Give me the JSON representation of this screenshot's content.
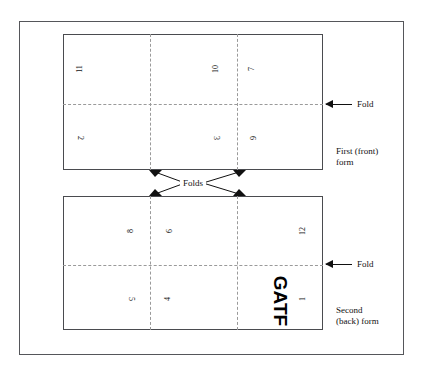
{
  "diagram": {
    "title_visible": false,
    "outer_frame": "figure-border",
    "forms": [
      {
        "id": "front",
        "label": "First (front)\nform",
        "page_numbers": [
          {
            "value": "11",
            "panel": "top-left",
            "rotation": "ccw"
          },
          {
            "value": "10",
            "panel": "top-center-right",
            "rotation": "ccw"
          },
          {
            "value": "7",
            "panel": "top-right",
            "rotation": "ccw"
          },
          {
            "value": "2",
            "panel": "bottom-left",
            "rotation": "cw"
          },
          {
            "value": "3",
            "panel": "bottom-center-right",
            "rotation": "cw"
          },
          {
            "value": "6",
            "panel": "bottom-right",
            "rotation": "cw"
          }
        ]
      },
      {
        "id": "back",
        "label": "Second\n(back) form",
        "page_numbers": [
          {
            "value": "8",
            "panel": "top-left-center",
            "rotation": "ccw"
          },
          {
            "value": "9",
            "panel": "top-center",
            "rotation": "cw"
          },
          {
            "value": "12",
            "panel": "top-right",
            "rotation": "ccw"
          },
          {
            "value": "5",
            "panel": "bottom-left-center",
            "rotation": "cw"
          },
          {
            "value": "4",
            "panel": "bottom-center",
            "rotation": "ccw"
          },
          {
            "value": "1",
            "panel": "bottom-right",
            "rotation": "ccw"
          }
        ],
        "logo": "GATF"
      }
    ],
    "callouts": [
      {
        "id": "fold-front",
        "text": "Fold"
      },
      {
        "id": "fold-back",
        "text": "Fold"
      }
    ],
    "folds_label": "Folds",
    "colors": {
      "frame": "#55565a",
      "sheet": "#4a4b4f",
      "fold_line": "#9a9a9a",
      "arrow": "#111111",
      "text": "#111111"
    }
  }
}
